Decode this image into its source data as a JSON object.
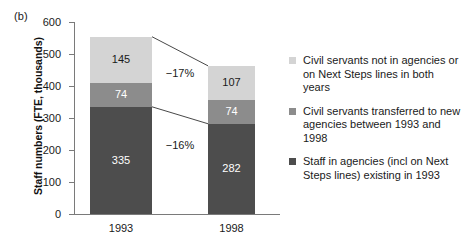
{
  "panel_letter": "(b)",
  "chart_data": {
    "type": "bar",
    "stacked": true,
    "title": "",
    "xlabel": "",
    "ylabel": "Staff numbers (FTE, thousands)",
    "ylim": [
      0,
      600
    ],
    "yticks": [
      0,
      100,
      200,
      300,
      400,
      500,
      600
    ],
    "ytick_labels": [
      "0",
      "100",
      "200",
      "300",
      "400",
      "500",
      "600"
    ],
    "grid": false,
    "legend_position": "right",
    "categories": [
      "1993",
      "1998"
    ],
    "series": [
      {
        "name": "Staff in agencies (incl on Next Steps lines) existing in 1993",
        "key": "bottom",
        "color": "#4d4d4d",
        "values": [
          335,
          282
        ],
        "labels": [
          "335",
          "282"
        ]
      },
      {
        "name": "Civil servants transferred to new agencies between 1993 and 1998",
        "key": "mid",
        "color": "#8c8c8c",
        "values": [
          74,
          74
        ],
        "labels": [
          "74",
          "74"
        ]
      },
      {
        "name": "Civil servants not in agencies or on Next Steps lines in both years",
        "key": "top",
        "color": "#d4d4d4",
        "values": [
          145,
          107
        ],
        "labels": [
          "145",
          "107"
        ]
      }
    ],
    "totals": [
      554,
      463
    ],
    "annotations": [
      {
        "text": "−17%",
        "connects": "top-of-bars"
      },
      {
        "text": "−16%",
        "connects": "top-of-dark-segment"
      }
    ]
  },
  "legend": {
    "items": [
      {
        "label": "Civil servants not in agencies or on Next Steps lines in both years",
        "color": "#d4d4d4"
      },
      {
        "label": "Civil servants transferred to new agencies between 1993 and 1998",
        "color": "#8c8c8c"
      },
      {
        "label": "Staff in agencies (incl on Next Steps lines) existing in 1993",
        "color": "#4d4d4d"
      }
    ]
  }
}
